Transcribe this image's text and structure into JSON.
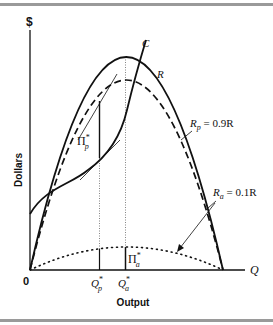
{
  "diagram": {
    "y_axis": {
      "symbol": "$",
      "label": "Dollars"
    },
    "x_axis": {
      "symbol": "Q",
      "label": "Output",
      "origin_label": "0"
    },
    "curves": {
      "revenue": {
        "label": "R"
      },
      "cost": {
        "label": "C"
      },
      "principal_revenue": {
        "label_main": "R",
        "label_sub": "p",
        "label_eq": " = 0.9R"
      },
      "agent_revenue": {
        "label_main": "R",
        "label_sub": "a",
        "label_eq": " = 0.1R"
      }
    },
    "markers": {
      "q_principal": {
        "main": "Q",
        "sub": "p",
        "sup": "*"
      },
      "q_agent": {
        "main": "Q",
        "sub": "a",
        "sup": "*"
      },
      "profit_principal": {
        "main": "Π",
        "sub": "p",
        "sup": "*"
      },
      "profit_agent": {
        "main": "Π",
        "sub": "a",
        "sup": "*"
      }
    },
    "colors": {
      "ink": "#111111",
      "rule": "#9a9a9a"
    }
  }
}
